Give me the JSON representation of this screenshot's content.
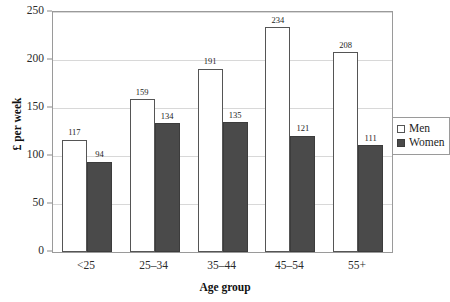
{
  "chart_data": {
    "type": "bar",
    "title": "",
    "subtitle": "",
    "xlabel": "Age group",
    "ylabel": "£ per week",
    "categories": [
      "<25",
      "25–34",
      "35–44",
      "45–54",
      "55+"
    ],
    "series": [
      {
        "name": "Men",
        "values": [
          117,
          159,
          191,
          234,
          208
        ],
        "color": "#ffffff",
        "edge_color": "#555555"
      },
      {
        "name": "Women",
        "values": [
          94,
          134,
          135,
          121,
          111
        ],
        "color": "#4a4a4a",
        "edge_color": "#3c3c3c"
      }
    ],
    "ylim": [
      0,
      250
    ],
    "yticks": [
      0,
      50,
      100,
      150,
      200,
      250
    ],
    "ytick_labels": [
      "0",
      "50",
      "100",
      "150",
      "200",
      "250"
    ],
    "grid": true,
    "grid_axis": "y",
    "legend_position": "right-middle",
    "legend_entries": [
      "Men",
      "Women"
    ],
    "bar_value_labels": true
  },
  "axes": {
    "y_title": "£ per week",
    "x_title": "Age group"
  },
  "legend": {
    "items": [
      {
        "label": "Men"
      },
      {
        "label": "Women"
      }
    ]
  }
}
